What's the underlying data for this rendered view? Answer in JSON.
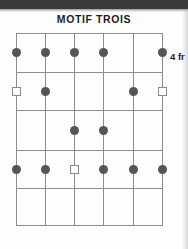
{
  "diagram": {
    "title": "MOTIF TROIS",
    "position_label": "4 fr",
    "instrument": "guitar",
    "string_count": 6,
    "fret_rows": 5,
    "starting_fret": 4,
    "colors": {
      "dot_fill": "#555555",
      "square_stroke": "#8a8a8a",
      "grid_line": "#8d8d8d",
      "text": "#1d1d1d",
      "background": "#fdfdfd"
    },
    "geometry": {
      "grid_left": 16,
      "grid_right": 162,
      "grid_top": 33,
      "grid_bottom": 225,
      "string_x": [
        16,
        45,
        74,
        103,
        133,
        162
      ],
      "fret_y": [
        33,
        72,
        110,
        150,
        188,
        225
      ],
      "label_x": 170,
      "label_y": 51
    },
    "markers": [
      {
        "string": 1,
        "row": 1,
        "type": "dot"
      },
      {
        "string": 2,
        "row": 1,
        "type": "dot"
      },
      {
        "string": 3,
        "row": 1,
        "type": "dot"
      },
      {
        "string": 4,
        "row": 1,
        "type": "dot"
      },
      {
        "string": 6,
        "row": 1,
        "type": "dot"
      },
      {
        "string": 1,
        "row": 2,
        "type": "square"
      },
      {
        "string": 2,
        "row": 2,
        "type": "dot"
      },
      {
        "string": 5,
        "row": 2,
        "type": "dot"
      },
      {
        "string": 6,
        "row": 2,
        "type": "square"
      },
      {
        "string": 3,
        "row": 3,
        "type": "dot"
      },
      {
        "string": 4,
        "row": 3,
        "type": "dot"
      },
      {
        "string": 1,
        "row": 4,
        "type": "dot"
      },
      {
        "string": 2,
        "row": 4,
        "type": "dot"
      },
      {
        "string": 3,
        "row": 4,
        "type": "square"
      },
      {
        "string": 4,
        "row": 4,
        "type": "dot"
      },
      {
        "string": 5,
        "row": 4,
        "type": "dot"
      },
      {
        "string": 6,
        "row": 4,
        "type": "dot"
      }
    ]
  }
}
